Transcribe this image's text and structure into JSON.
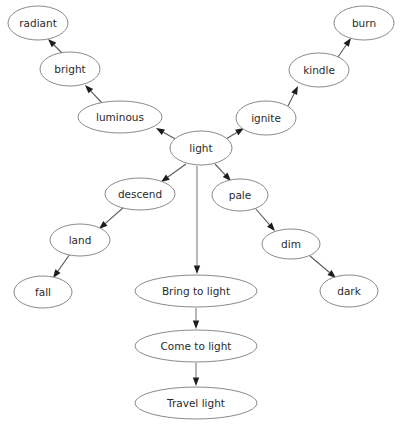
{
  "diagram": {
    "type": "directed-graph",
    "background_color": "#ffffff",
    "node_fill_color": "#ffffff",
    "node_stroke_color": "#8a8a8a",
    "edge_color": "#5a5a5a",
    "vertical_edge_color": "#7d7d7d",
    "arrowhead_color": "#1d1d1d",
    "label_color": "#2b2b2b",
    "nodes": [
      {
        "id": "radiant",
        "label": "radiant",
        "cx": 38,
        "cy": 23,
        "rx": 30,
        "ry": 17
      },
      {
        "id": "burn",
        "label": "burn",
        "cx": 364,
        "cy": 23,
        "rx": 30,
        "ry": 17
      },
      {
        "id": "bright",
        "label": "bright",
        "cx": 70,
        "cy": 69,
        "rx": 30,
        "ry": 17
      },
      {
        "id": "kindle",
        "label": "kindle",
        "cx": 319,
        "cy": 70,
        "rx": 30,
        "ry": 17
      },
      {
        "id": "luminous",
        "label": "luminous",
        "cx": 120,
        "cy": 117,
        "rx": 42,
        "ry": 16
      },
      {
        "id": "ignite",
        "label": "ignite",
        "cx": 266,
        "cy": 118,
        "rx": 30,
        "ry": 17
      },
      {
        "id": "light",
        "label": "light",
        "cx": 201,
        "cy": 148,
        "rx": 31,
        "ry": 17
      },
      {
        "id": "descend",
        "label": "descend",
        "cx": 140,
        "cy": 194,
        "rx": 35,
        "ry": 16
      },
      {
        "id": "pale",
        "label": "pale",
        "cx": 240,
        "cy": 195,
        "rx": 28,
        "ry": 16
      },
      {
        "id": "land",
        "label": "land",
        "cx": 80,
        "cy": 240,
        "rx": 30,
        "ry": 16
      },
      {
        "id": "dim",
        "label": "dim",
        "cx": 291,
        "cy": 244,
        "rx": 29,
        "ry": 15
      },
      {
        "id": "fall",
        "label": "fall",
        "cx": 43,
        "cy": 292,
        "rx": 29,
        "ry": 16
      },
      {
        "id": "bring-to-light",
        "label": "Bring to light",
        "cx": 196,
        "cy": 291,
        "rx": 61,
        "ry": 16
      },
      {
        "id": "dark",
        "label": "dark",
        "cx": 349,
        "cy": 291,
        "rx": 29,
        "ry": 16
      },
      {
        "id": "come-to-light",
        "label": "Come to light",
        "cx": 196,
        "cy": 346,
        "rx": 61,
        "ry": 16
      },
      {
        "id": "travel-light",
        "label": "Travel light",
        "cx": 196,
        "cy": 403,
        "rx": 61,
        "ry": 16
      }
    ],
    "edges": [
      {
        "from": "bright",
        "to": "radiant",
        "x1": 62,
        "y1": 53,
        "x2": 48,
        "y2": 39,
        "style": "diagonal"
      },
      {
        "from": "luminous",
        "to": "bright",
        "x1": 103,
        "y1": 104,
        "x2": 85,
        "y2": 85,
        "style": "diagonal"
      },
      {
        "from": "light",
        "to": "luminous",
        "x1": 177,
        "y1": 140,
        "x2": 156,
        "y2": 128,
        "style": "diagonal"
      },
      {
        "from": "light",
        "to": "ignite",
        "x1": 226,
        "y1": 139,
        "x2": 244,
        "y2": 128,
        "style": "diagonal"
      },
      {
        "from": "ignite",
        "to": "kindle",
        "x1": 288,
        "y1": 106,
        "x2": 298,
        "y2": 86,
        "style": "diagonal"
      },
      {
        "from": "kindle",
        "to": "burn",
        "x1": 338,
        "y1": 57,
        "x2": 351,
        "y2": 38,
        "style": "diagonal"
      },
      {
        "from": "light",
        "to": "descend",
        "x1": 186,
        "y1": 164,
        "x2": 161,
        "y2": 182,
        "style": "diagonal"
      },
      {
        "from": "light",
        "to": "pale",
        "x1": 215,
        "y1": 164,
        "x2": 231,
        "y2": 181,
        "style": "diagonal"
      },
      {
        "from": "descend",
        "to": "land",
        "x1": 124,
        "y1": 207,
        "x2": 99,
        "y2": 229,
        "style": "diagonal"
      },
      {
        "from": "land",
        "to": "fall",
        "x1": 70,
        "y1": 254,
        "x2": 53,
        "y2": 278,
        "style": "diagonal"
      },
      {
        "from": "pale",
        "to": "dim",
        "x1": 255,
        "y1": 208,
        "x2": 275,
        "y2": 231,
        "style": "diagonal"
      },
      {
        "from": "dim",
        "to": "dark",
        "x1": 310,
        "y1": 256,
        "x2": 336,
        "y2": 278,
        "style": "diagonal"
      },
      {
        "from": "light",
        "to": "bring-to-light",
        "x1": 197,
        "y1": 166,
        "x2": 197,
        "y2": 274,
        "style": "vertical"
      },
      {
        "from": "bring-to-light",
        "to": "come-to-light",
        "x1": 196,
        "y1": 308,
        "x2": 196,
        "y2": 329,
        "style": "vertical"
      },
      {
        "from": "come-to-light",
        "to": "travel-light",
        "x1": 196,
        "y1": 363,
        "x2": 196,
        "y2": 386,
        "style": "vertical"
      }
    ]
  }
}
